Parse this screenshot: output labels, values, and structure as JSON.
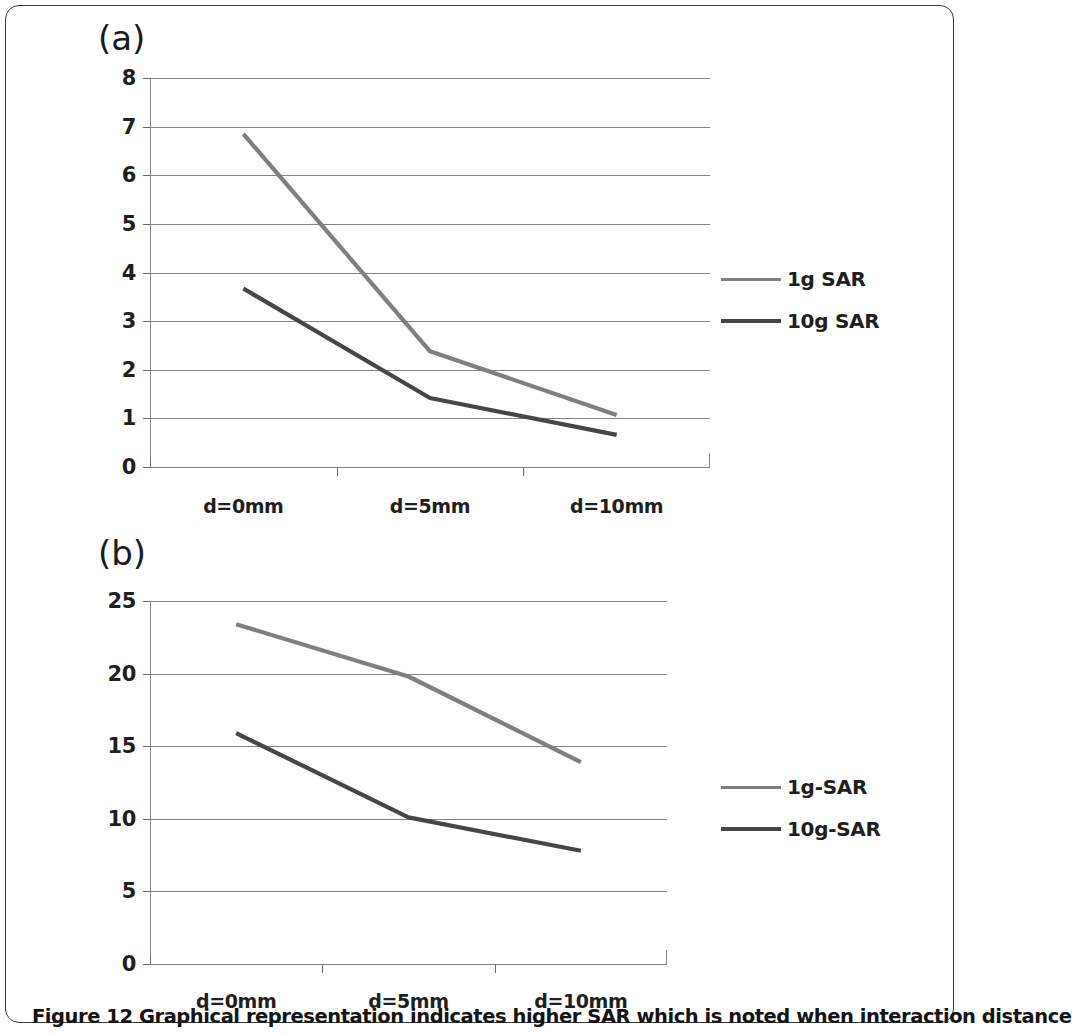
{
  "figure": {
    "caption_prefix": "Figure 12",
    "caption_text": "Graphical representation indicates higher SAR which is noted when interaction distance",
    "caption_full": "Figure 12 Graphical representation indicates higher SAR which is noted when interaction distance"
  },
  "panels": [
    {
      "label": "(a)"
    },
    {
      "label": "(b)"
    }
  ],
  "colors": {
    "series_1g": "#7f7f7f",
    "series_10g": "#464646",
    "gridline": "#6e6e6e",
    "text": "#1f1f1f",
    "frame": "#3a3a3a"
  },
  "chart_data": [
    {
      "type": "line",
      "panel": "(a)",
      "title": "",
      "xlabel": "",
      "ylabel": "",
      "categories": [
        "d=0mm",
        "d=5mm",
        "d=10mm"
      ],
      "ylim": [
        0,
        8
      ],
      "yticks": [
        0,
        1,
        2,
        3,
        4,
        5,
        6,
        7,
        8
      ],
      "ytick_labels": [
        "0",
        "1",
        "2",
        "3",
        "4",
        "5",
        "6",
        "7",
        "8"
      ],
      "grid": true,
      "legend_position": "right",
      "series": [
        {
          "name": "1g SAR",
          "values": [
            6.85,
            2.38,
            1.07
          ],
          "color": "#7f7f7f"
        },
        {
          "name": "10g SAR",
          "values": [
            3.67,
            1.42,
            0.66
          ],
          "color": "#464646"
        }
      ]
    },
    {
      "type": "line",
      "panel": "(b)",
      "title": "",
      "xlabel": "",
      "ylabel": "",
      "categories": [
        "d=0mm",
        "d=5mm",
        "d=10mm"
      ],
      "ylim": [
        0,
        25
      ],
      "yticks": [
        0,
        5,
        10,
        15,
        20,
        25
      ],
      "ytick_labels": [
        "0",
        "5",
        "10",
        "15",
        "20",
        "25"
      ],
      "grid": true,
      "legend_position": "right",
      "series": [
        {
          "name": "1g-SAR",
          "values": [
            23.4,
            19.8,
            13.9
          ],
          "color": "#7f7f7f"
        },
        {
          "name": "10g-SAR",
          "values": [
            15.9,
            10.1,
            7.8
          ],
          "color": "#464646"
        }
      ]
    }
  ]
}
